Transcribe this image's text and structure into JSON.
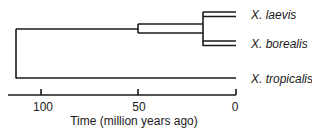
{
  "diagram": {
    "type": "phylogenetic-tree",
    "taxa": [
      {
        "label": "X. laevis"
      },
      {
        "label": "X. borealis"
      },
      {
        "label": "X. tropicalis"
      }
    ],
    "axis": {
      "title": "Time (million years ago)",
      "ticks": [
        {
          "label": "100",
          "value": 100
        },
        {
          "label": "50",
          "value": 50
        },
        {
          "label": "0",
          "value": 0
        }
      ]
    },
    "nodes": {
      "root_age_mya": 112,
      "laevis_borealis_split_mya": 50,
      "tetraploid_split_mya": 15
    },
    "colors": {
      "line": "#1a1a1a",
      "background": "#ffffff"
    }
  }
}
